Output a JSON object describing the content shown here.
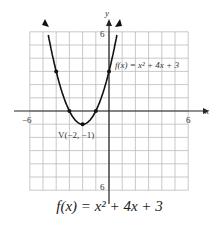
{
  "chart_data": {
    "type": "line",
    "xlabel": "x",
    "ylabel": "y",
    "xlim": [
      -6,
      6
    ],
    "ylim": [
      -6,
      6
    ],
    "grid": true,
    "x_tick_labels": [
      "-6",
      "6"
    ],
    "y_tick_labels": [
      "6",
      "-6"
    ],
    "series": [
      {
        "name": "f(x) = x^2 + 4x + 3",
        "x": [
          -4.6,
          -4,
          -3,
          -2,
          -1,
          0,
          0.6
        ],
        "y": [
          6.16,
          3,
          0,
          -1,
          0,
          3,
          5.76
        ]
      }
    ],
    "points": [
      {
        "x": -4,
        "y": 3
      },
      {
        "x": -3,
        "y": 0
      },
      {
        "x": -2,
        "y": -1
      },
      {
        "x": -1,
        "y": 0
      },
      {
        "x": 0,
        "y": 3
      }
    ],
    "annotations": [
      {
        "text": "f(x) = x² + 4x + 3",
        "x": 0.5,
        "y": 3.5
      },
      {
        "text": "V(−2, −1)",
        "x": -2,
        "y": -2
      }
    ]
  },
  "labels": {
    "x_axis": "x",
    "y_axis": "y",
    "x_min": "−6",
    "x_max": "6",
    "y_max": "6",
    "y_min": "6",
    "curve_label": "f(x) = x² + 4x + 3",
    "vertex_label": "V(−2, −1)",
    "caption": "f(x) = x² + 4x + 3"
  }
}
